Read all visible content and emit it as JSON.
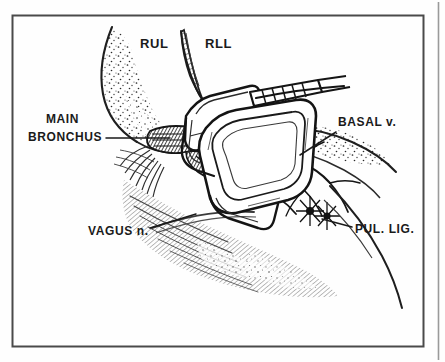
{
  "figure": {
    "kind": "anatomical-line-drawing",
    "style": "scanned black-and-white medical illustration, stippled and hatched pen-and-ink",
    "background_color": "#fefefe",
    "ink_color": "#1a1a1a",
    "frame": {
      "visible": true,
      "color": "#4a4a4a",
      "x": 12,
      "y": 15,
      "width": 412,
      "height": 332
    },
    "page_edge_rule": {
      "visible": true,
      "x": 438
    }
  },
  "labels": [
    {
      "id": "rul",
      "text": "RUL",
      "meaning": "right upper lobe",
      "x": 140,
      "y": 48,
      "size": 13,
      "leader": false
    },
    {
      "id": "rll",
      "text": "RLL",
      "meaning": "right lower lobe",
      "x": 205,
      "y": 48,
      "size": 13,
      "leader": false
    },
    {
      "id": "main-bronchus",
      "text_line1": "MAIN",
      "text_line2": "BRONCHUS",
      "meaning": "main bronchus",
      "x": 46,
      "y": 123,
      "size": 12,
      "leader": true,
      "leader_path": "M 106,138 L 170,138"
    },
    {
      "id": "basal-v",
      "text": "BASAL v.",
      "meaning": "basal vein",
      "x": 338,
      "y": 126,
      "size": 12,
      "leader": true,
      "leader_path": "M 336,132 L 300,155"
    },
    {
      "id": "vagus-n",
      "text": "VAGUS n.",
      "meaning": "vagus nerve",
      "x": 88,
      "y": 235,
      "size": 12,
      "leader": true,
      "leader_path": "M 150,228 L 196,214"
    },
    {
      "id": "pul-lig",
      "text": "PUL. LIG.",
      "meaning": "pulmonary ligament",
      "x": 355,
      "y": 233,
      "size": 12,
      "leader": true,
      "leader_path": "M 352,227 L 322,219"
    }
  ],
  "structures": [
    {
      "id": "rul-lung-mass",
      "name": "right upper lobe lung tissue",
      "texture": "stipple"
    },
    {
      "id": "rll-fissure-wedge",
      "name": "oblique fissure wedge",
      "texture": "hatch"
    },
    {
      "id": "hilar-vessels",
      "name": "hilar vessels and nodes",
      "texture": "dense-ink"
    },
    {
      "id": "lower-lobe-surface",
      "name": "lower lobe / mediastinal surface",
      "texture": "fine-hatch"
    },
    {
      "id": "stapler",
      "name": "surgical stapler clamp",
      "texture": "outline"
    }
  ]
}
